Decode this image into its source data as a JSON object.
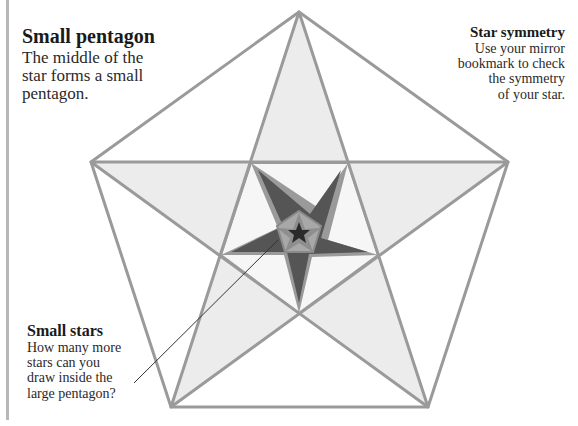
{
  "captions": {
    "small_pentagon": {
      "title": "Small pentagon",
      "lines": [
        "The middle of the",
        "star forms a small",
        "pentagon."
      ]
    },
    "star_symmetry": {
      "title": "Star symmetry",
      "lines": [
        "Use your mirror",
        "bookmark to check",
        "the symmetry",
        "of your star."
      ]
    },
    "small_stars": {
      "title": "Small stars",
      "lines": [
        "How many more",
        "stars can you",
        "draw inside the",
        "large pentagon?"
      ]
    }
  },
  "figure": {
    "colors": {
      "outline": "#9a9a9a",
      "star_fill": "#ececec",
      "inner_star": "#5a5a5a",
      "small_pentagon": "#a6a6a6",
      "center_star": "#2a2a2a",
      "leader_line": "#333333",
      "page_border": "#b8b8b8"
    }
  }
}
